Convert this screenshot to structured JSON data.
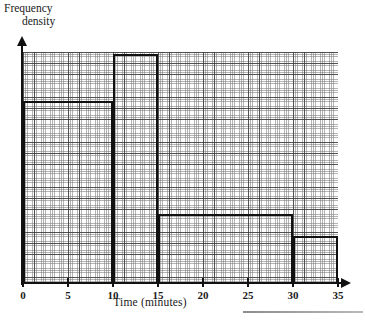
{
  "chart_data": {
    "type": "bar",
    "title": "",
    "subtitle": "",
    "xlabel": "Time (minutes)",
    "ylabel": "Frequency density",
    "ylabel_line1": "Frequency",
    "ylabel_line2": "density",
    "xlim": [
      0,
      35
    ],
    "ylim": [
      0,
      5.2
    ],
    "grid": true,
    "grid_style": "graph-paper",
    "legend": false,
    "x_ticks": [
      0,
      5,
      10,
      15,
      20,
      25,
      30,
      35
    ],
    "x_tick_labels": [
      "0",
      "5",
      "10",
      "15",
      "20",
      "25",
      "30",
      "35"
    ],
    "y_ticks": [],
    "y_tick_labels": [],
    "categories": [
      "0-10",
      "10-15",
      "15-30",
      "30-35"
    ],
    "bins": [
      {
        "label": "0-10",
        "x_start": 0,
        "x_end": 10,
        "frequency_density": 4.1
      },
      {
        "label": "10-15",
        "x_start": 10,
        "x_end": 15,
        "frequency_density": 5.15
      },
      {
        "label": "15-30",
        "x_start": 15,
        "x_end": 30,
        "frequency_density": 1.55
      },
      {
        "label": "30-35",
        "x_start": 30,
        "x_end": 35,
        "frequency_density": 1.05
      }
    ],
    "values": [
      4.1,
      5.15,
      1.55,
      1.05
    ]
  },
  "colors": {
    "ink": "#111111",
    "grid_major": "#3c3c3c",
    "grid_minor": "#787878",
    "paper": "#ffffff"
  }
}
